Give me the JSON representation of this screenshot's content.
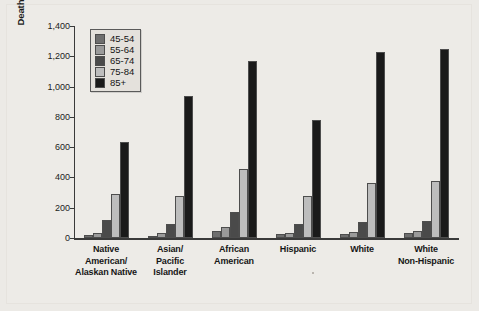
{
  "chart_data": {
    "type": "bar",
    "title": "",
    "xlabel": "",
    "ylabel": "Deaths per 100,000 resident population",
    "ylim": [
      0,
      1400
    ],
    "yticks": [
      0,
      200,
      400,
      600,
      800,
      1000,
      1200,
      1400
    ],
    "ytick_labels": [
      "0",
      "200",
      "400",
      "600",
      "800",
      "1,000",
      "1,200",
      "1,400"
    ],
    "grid": false,
    "legend_position": "upper-left-inside",
    "categories": [
      "Native American/ Alaskan Native",
      "Asian/ Pacific Islander",
      "African American",
      "Hispanic",
      "White",
      "White Non-Hispanic"
    ],
    "category_lines": [
      [
        "Native",
        "American/",
        "Alaskan Native"
      ],
      [
        "Asian/",
        "Pacific",
        "Islander"
      ],
      [
        "African",
        "American"
      ],
      [
        "Hispanic"
      ],
      [
        "White"
      ],
      [
        "White",
        "Non-Hispanic"
      ]
    ],
    "series": [
      {
        "name": "45-54",
        "color": "#6e6e6e",
        "values": [
          18,
          15,
          48,
          28,
          26,
          33
        ]
      },
      {
        "name": "55-64",
        "color": "#9a9a9a",
        "values": [
          36,
          33,
          72,
          36,
          43,
          45
        ]
      },
      {
        "name": "65-74",
        "color": "#4a4a4a",
        "values": [
          122,
          90,
          170,
          95,
          108,
          110
        ]
      },
      {
        "name": "75-84",
        "color": "#bdbdbd",
        "values": [
          288,
          277,
          458,
          280,
          365,
          378
        ]
      },
      {
        "name": "85+",
        "color": "#1a1a1a",
        "values": [
          632,
          940,
          1167,
          782,
          1228,
          1248
        ]
      }
    ]
  }
}
